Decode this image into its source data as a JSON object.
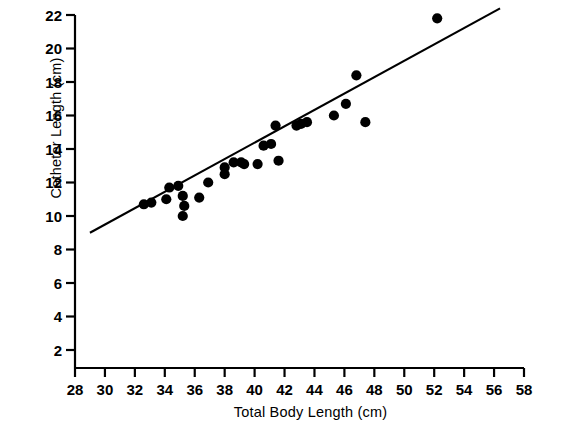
{
  "figure": {
    "title": "",
    "x_axis_label": "Total Body Length (cm)",
    "y_axis_label": "Catheter Length (cm)",
    "marker_color": "#000000",
    "line_color": "#000000",
    "axis_color": "#000000",
    "background": "#ffffff"
  },
  "chart_data": {
    "type": "scatter",
    "title": "",
    "xlabel": "Total Body Length (cm)",
    "ylabel": "Catheter Length (cm)",
    "xlim": [
      28,
      58
    ],
    "ylim": [
      1,
      22.8
    ],
    "xticks": [
      28,
      30,
      32,
      34,
      36,
      38,
      40,
      42,
      44,
      46,
      48,
      50,
      52,
      54,
      56,
      58
    ],
    "yticks": [
      2,
      4,
      6,
      8,
      10,
      12,
      14,
      16,
      18,
      20,
      22
    ],
    "xtick_labels": [
      "28",
      "30",
      "32",
      "34",
      "36",
      "38",
      "40",
      "42",
      "44",
      "46",
      "48",
      "50",
      "52",
      "54",
      "56",
      "58"
    ],
    "ytick_labels": [
      "2",
      "4",
      "6",
      "8",
      "10",
      "12",
      "14",
      "16",
      "18",
      "20",
      "22"
    ],
    "grid": false,
    "legend": null,
    "series": [
      {
        "name": "Observations",
        "marker": "filled-circle",
        "color": "#000000",
        "points": [
          {
            "x": 32.6,
            "y": 10.7
          },
          {
            "x": 33.1,
            "y": 10.8
          },
          {
            "x": 34.1,
            "y": 11.0
          },
          {
            "x": 34.3,
            "y": 11.7
          },
          {
            "x": 34.9,
            "y": 11.8
          },
          {
            "x": 35.2,
            "y": 11.2
          },
          {
            "x": 35.3,
            "y": 10.6
          },
          {
            "x": 35.2,
            "y": 10.0
          },
          {
            "x": 36.3,
            "y": 11.1
          },
          {
            "x": 36.9,
            "y": 12.0
          },
          {
            "x": 38.0,
            "y": 12.9
          },
          {
            "x": 38.0,
            "y": 12.5
          },
          {
            "x": 38.6,
            "y": 13.2
          },
          {
            "x": 39.1,
            "y": 13.2
          },
          {
            "x": 39.3,
            "y": 13.1
          },
          {
            "x": 40.2,
            "y": 13.1
          },
          {
            "x": 40.6,
            "y": 14.2
          },
          {
            "x": 41.1,
            "y": 14.3
          },
          {
            "x": 41.4,
            "y": 15.4
          },
          {
            "x": 41.6,
            "y": 13.3
          },
          {
            "x": 42.8,
            "y": 15.4
          },
          {
            "x": 43.1,
            "y": 15.5
          },
          {
            "x": 43.5,
            "y": 15.6
          },
          {
            "x": 45.3,
            "y": 16.0
          },
          {
            "x": 46.1,
            "y": 16.7
          },
          {
            "x": 46.8,
            "y": 18.4
          },
          {
            "x": 47.4,
            "y": 15.6
          },
          {
            "x": 52.2,
            "y": 21.8
          }
        ]
      }
    ],
    "fit_line": {
      "name": "regression-line",
      "color": "#000000",
      "x_start": 29.0,
      "y_start": 9.0,
      "x_end": 56.4,
      "y_end": 22.4
    }
  }
}
